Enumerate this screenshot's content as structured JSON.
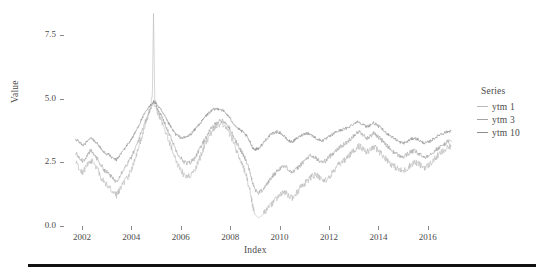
{
  "chart_data": {
    "type": "line",
    "title": "",
    "xlabel": "Index",
    "ylabel": "Value",
    "xlim": [
      2001.6,
      2017.1
    ],
    "ylim": [
      0.0,
      8.4
    ],
    "grid": false,
    "legend_position": "right",
    "legend_title": "Series",
    "xticks": [
      "2002",
      "2004",
      "2006",
      "2008",
      "2010",
      "2012",
      "2014",
      "2016"
    ],
    "xtick_values": [
      2002,
      2004,
      2006,
      2008,
      2010,
      2012,
      2014,
      2016
    ],
    "yticks": [
      "0.0",
      "2.5",
      "5.0",
      "7.5"
    ],
    "ytick_values": [
      0.0,
      2.5,
      5.0,
      7.5
    ],
    "annotations": [
      "Sharp vertical spike to ~8.4 near 2004.9 in ytm 1",
      "Deep trough near 2008.9 in ytm 1 down to ~0.3"
    ],
    "series": [
      {
        "name": "ytm 1",
        "color": "#b9b9b9",
        "x": [
          2001.75,
          2001.9,
          2002.05,
          2002.2,
          2002.35,
          2002.5,
          2002.65,
          2002.8,
          2002.95,
          2003.1,
          2003.25,
          2003.4,
          2003.55,
          2003.7,
          2003.85,
          2004.0,
          2004.15,
          2004.3,
          2004.45,
          2004.6,
          2004.75,
          2004.85,
          2004.9,
          2004.95,
          2005.05,
          2005.2,
          2005.35,
          2005.5,
          2005.65,
          2005.8,
          2005.95,
          2006.1,
          2006.25,
          2006.4,
          2006.55,
          2006.7,
          2006.85,
          2007.0,
          2007.15,
          2007.3,
          2007.45,
          2007.6,
          2007.75,
          2007.9,
          2008.05,
          2008.2,
          2008.35,
          2008.5,
          2008.65,
          2008.8,
          2008.9,
          2009.0,
          2009.15,
          2009.3,
          2009.45,
          2009.6,
          2009.75,
          2009.9,
          2010.05,
          2010.2,
          2010.35,
          2010.5,
          2010.65,
          2010.8,
          2010.95,
          2011.1,
          2011.25,
          2011.4,
          2011.55,
          2011.7,
          2011.85,
          2012.0,
          2012.15,
          2012.3,
          2012.45,
          2012.6,
          2012.75,
          2012.9,
          2013.05,
          2013.2,
          2013.35,
          2013.5,
          2013.65,
          2013.8,
          2013.95,
          2014.1,
          2014.25,
          2014.4,
          2014.55,
          2014.7,
          2014.85,
          2015.0,
          2015.15,
          2015.3,
          2015.45,
          2015.6,
          2015.75,
          2015.9,
          2016.05,
          2016.2,
          2016.35,
          2016.5,
          2016.65,
          2016.8,
          2016.95
        ],
        "y": [
          2.55,
          2.25,
          2.1,
          2.35,
          2.6,
          2.45,
          2.2,
          1.85,
          1.65,
          1.55,
          1.35,
          1.2,
          1.45,
          1.7,
          1.9,
          2.2,
          2.6,
          3.1,
          3.6,
          4.1,
          4.6,
          5.1,
          8.35,
          4.95,
          4.5,
          4.2,
          3.8,
          3.4,
          3.0,
          2.6,
          2.3,
          2.05,
          1.95,
          2.0,
          2.2,
          2.5,
          2.85,
          3.2,
          3.5,
          3.75,
          3.9,
          4.0,
          3.95,
          3.8,
          3.5,
          3.1,
          2.75,
          2.4,
          2.0,
          1.4,
          0.85,
          0.45,
          0.32,
          0.42,
          0.6,
          0.75,
          0.95,
          1.1,
          1.25,
          1.3,
          1.2,
          1.1,
          1.25,
          1.45,
          1.6,
          1.75,
          1.9,
          2.0,
          1.95,
          1.85,
          1.8,
          1.9,
          2.1,
          2.3,
          2.45,
          2.55,
          2.7,
          2.85,
          3.0,
          3.15,
          3.05,
          2.9,
          2.95,
          3.1,
          3.0,
          2.85,
          2.7,
          2.55,
          2.4,
          2.3,
          2.2,
          2.15,
          2.25,
          2.4,
          2.5,
          2.45,
          2.35,
          2.3,
          2.4,
          2.55,
          2.7,
          2.85,
          2.95,
          3.05,
          3.15
        ]
      },
      {
        "name": "ytm 3",
        "color": "#a3a3a3",
        "x": [
          2001.75,
          2001.9,
          2002.05,
          2002.2,
          2002.35,
          2002.5,
          2002.65,
          2002.8,
          2002.95,
          2003.1,
          2003.25,
          2003.4,
          2003.55,
          2003.7,
          2003.85,
          2004.0,
          2004.15,
          2004.3,
          2004.45,
          2004.6,
          2004.75,
          2004.9,
          2005.05,
          2005.2,
          2005.35,
          2005.5,
          2005.65,
          2005.8,
          2005.95,
          2006.1,
          2006.25,
          2006.4,
          2006.55,
          2006.7,
          2006.85,
          2007.0,
          2007.15,
          2007.3,
          2007.45,
          2007.6,
          2007.75,
          2007.9,
          2008.05,
          2008.2,
          2008.35,
          2008.5,
          2008.65,
          2008.8,
          2008.9,
          2009.0,
          2009.15,
          2009.3,
          2009.45,
          2009.6,
          2009.75,
          2009.9,
          2010.05,
          2010.2,
          2010.35,
          2010.5,
          2010.65,
          2010.8,
          2010.95,
          2011.1,
          2011.25,
          2011.4,
          2011.55,
          2011.7,
          2011.85,
          2012.0,
          2012.15,
          2012.3,
          2012.45,
          2012.6,
          2012.75,
          2012.9,
          2013.05,
          2013.2,
          2013.35,
          2013.5,
          2013.65,
          2013.8,
          2013.95,
          2014.1,
          2014.25,
          2014.4,
          2014.55,
          2014.7,
          2014.85,
          2015.0,
          2015.15,
          2015.3,
          2015.45,
          2015.6,
          2015.75,
          2015.9,
          2016.05,
          2016.2,
          2016.35,
          2016.5,
          2016.65,
          2016.8,
          2016.95
        ],
        "y": [
          2.85,
          2.7,
          2.55,
          2.75,
          2.95,
          2.8,
          2.6,
          2.35,
          2.15,
          2.05,
          1.85,
          1.75,
          2.0,
          2.25,
          2.45,
          2.7,
          3.0,
          3.4,
          3.8,
          4.2,
          4.55,
          4.85,
          4.6,
          4.35,
          4.05,
          3.7,
          3.35,
          3.0,
          2.75,
          2.55,
          2.45,
          2.5,
          2.65,
          2.9,
          3.15,
          3.45,
          3.7,
          3.9,
          4.05,
          4.15,
          4.1,
          3.95,
          3.7,
          3.4,
          3.1,
          2.85,
          2.55,
          2.15,
          1.75,
          1.45,
          1.3,
          1.4,
          1.6,
          1.8,
          2.0,
          2.15,
          2.3,
          2.35,
          2.25,
          2.1,
          2.2,
          2.35,
          2.5,
          2.65,
          2.75,
          2.7,
          2.6,
          2.5,
          2.55,
          2.7,
          2.85,
          3.0,
          3.1,
          3.2,
          3.3,
          3.45,
          3.6,
          3.7,
          3.6,
          3.45,
          3.5,
          3.65,
          3.55,
          3.4,
          3.25,
          3.1,
          2.95,
          2.85,
          2.75,
          2.7,
          2.8,
          2.9,
          2.95,
          2.85,
          2.75,
          2.7,
          2.8,
          2.9,
          3.0,
          3.1,
          3.2,
          3.3,
          3.35
        ]
      },
      {
        "name": "ytm 10",
        "color": "#8c8c8c",
        "x": [
          2001.75,
          2001.9,
          2002.05,
          2002.2,
          2002.35,
          2002.5,
          2002.65,
          2002.8,
          2002.95,
          2003.1,
          2003.25,
          2003.4,
          2003.55,
          2003.7,
          2003.85,
          2004.0,
          2004.15,
          2004.3,
          2004.45,
          2004.6,
          2004.75,
          2004.9,
          2005.05,
          2005.2,
          2005.35,
          2005.5,
          2005.65,
          2005.8,
          2005.95,
          2006.1,
          2006.25,
          2006.4,
          2006.55,
          2006.7,
          2006.85,
          2007.0,
          2007.15,
          2007.3,
          2007.45,
          2007.6,
          2007.75,
          2007.9,
          2008.05,
          2008.2,
          2008.35,
          2008.5,
          2008.65,
          2008.8,
          2008.9,
          2009.0,
          2009.15,
          2009.3,
          2009.45,
          2009.6,
          2009.75,
          2009.9,
          2010.05,
          2010.2,
          2010.35,
          2010.5,
          2010.65,
          2010.8,
          2010.95,
          2011.1,
          2011.25,
          2011.4,
          2011.55,
          2011.7,
          2011.85,
          2012.0,
          2012.15,
          2012.3,
          2012.45,
          2012.6,
          2012.75,
          2012.9,
          2013.05,
          2013.2,
          2013.35,
          2013.5,
          2013.65,
          2013.8,
          2013.95,
          2014.1,
          2014.25,
          2014.4,
          2014.55,
          2014.7,
          2014.85,
          2015.0,
          2015.15,
          2015.3,
          2015.45,
          2015.6,
          2015.75,
          2015.9,
          2016.05,
          2016.2,
          2016.35,
          2016.5,
          2016.65,
          2016.8,
          2016.95
        ],
        "y": [
          3.4,
          3.3,
          3.15,
          3.3,
          3.45,
          3.35,
          3.2,
          3.0,
          2.85,
          2.8,
          2.65,
          2.6,
          2.8,
          3.0,
          3.2,
          3.4,
          3.65,
          3.95,
          4.25,
          4.5,
          4.7,
          4.9,
          4.75,
          4.55,
          4.3,
          4.05,
          3.8,
          3.6,
          3.5,
          3.45,
          3.5,
          3.6,
          3.75,
          3.95,
          4.1,
          4.3,
          4.45,
          4.55,
          4.6,
          4.6,
          4.5,
          4.35,
          4.15,
          3.95,
          3.8,
          3.7,
          3.55,
          3.3,
          3.1,
          3.0,
          3.05,
          3.2,
          3.4,
          3.55,
          3.65,
          3.7,
          3.65,
          3.5,
          3.35,
          3.3,
          3.4,
          3.5,
          3.6,
          3.65,
          3.6,
          3.5,
          3.4,
          3.35,
          3.4,
          3.5,
          3.6,
          3.7,
          3.75,
          3.8,
          3.85,
          3.95,
          4.05,
          4.1,
          4.0,
          3.9,
          3.95,
          4.05,
          3.95,
          3.85,
          3.7,
          3.6,
          3.5,
          3.4,
          3.3,
          3.25,
          3.3,
          3.4,
          3.45,
          3.4,
          3.3,
          3.25,
          3.3,
          3.4,
          3.5,
          3.6,
          3.65,
          3.7,
          3.75
        ]
      }
    ]
  },
  "axes": {
    "ylabel": "Value",
    "xlabel": "Index"
  },
  "legend": {
    "title": "Series",
    "items": [
      {
        "label": "ytm 1",
        "color": "#b9b9b9"
      },
      {
        "label": "ytm 3",
        "color": "#a3a3a3"
      },
      {
        "label": "ytm 10",
        "color": "#8c8c8c"
      }
    ]
  }
}
